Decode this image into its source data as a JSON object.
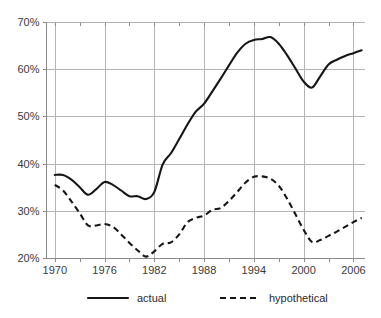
{
  "chart_data": {
    "type": "line",
    "title": "",
    "xlabel": "",
    "ylabel": "",
    "xlim": [
      1969.0,
      2007.4
    ],
    "ylim": [
      20,
      70
    ],
    "grid": true,
    "legend_position": "bottom",
    "y_ticks": [
      20,
      30,
      40,
      50,
      60,
      70
    ],
    "y_tick_labels": [
      "20%",
      "30%",
      "40%",
      "50%",
      "60%",
      "70%"
    ],
    "x_ticks": [
      1970,
      1976,
      1982,
      1988,
      1994,
      2000,
      2006
    ],
    "x_tick_labels": [
      "1970",
      "1976",
      "1982",
      "1988",
      "1994",
      "2000",
      "2006"
    ],
    "x_minor_ticks": [
      1973,
      1979,
      1985,
      1991,
      1997,
      2003
    ],
    "series": [
      {
        "name": "actual",
        "style": "solid",
        "color": "#161616",
        "x": [
          1970,
          1971,
          1972,
          1973,
          1974,
          1975,
          1976,
          1977,
          1978,
          1979,
          1980,
          1981,
          1982,
          1983,
          1984,
          1985,
          1986,
          1987,
          1988,
          1989,
          1990,
          1991,
          1992,
          1993,
          1994,
          1995,
          1996,
          1997,
          1998,
          1999,
          2000,
          2001,
          2002,
          2003,
          2004,
          2005,
          2006,
          2007
        ],
        "values": [
          37.6,
          37.6,
          36.6,
          35.0,
          33.4,
          34.6,
          36.1,
          35.5,
          34.3,
          33.1,
          33.1,
          32.5,
          34.0,
          39.8,
          42.2,
          45.2,
          48.3,
          51.0,
          52.7,
          55.3,
          58.0,
          60.8,
          63.5,
          65.4,
          66.2,
          66.4,
          66.8,
          65.4,
          63.0,
          60.2,
          57.4,
          56.1,
          58.5,
          61.0,
          62.0,
          62.8,
          63.4,
          64.0
        ]
      },
      {
        "name": "hypothetical",
        "style": "dashed",
        "color": "#161616",
        "x": [
          1970,
          1971,
          1972,
          1973,
          1974,
          1975,
          1976,
          1977,
          1978,
          1979,
          1980,
          1981,
          1982,
          1983,
          1984,
          1985,
          1986,
          1987,
          1988,
          1989,
          1990,
          1991,
          1992,
          1993,
          1994,
          1995,
          1996,
          1997,
          1998,
          1999,
          2000,
          2001,
          2002,
          2003,
          2004,
          2005,
          2006,
          2007
        ],
        "values": [
          35.5,
          34.3,
          32.0,
          29.5,
          26.9,
          26.9,
          27.2,
          26.6,
          25.0,
          23.2,
          21.6,
          20.3,
          21.4,
          23.0,
          23.3,
          25.0,
          27.6,
          28.5,
          29.0,
          30.2,
          30.6,
          32.1,
          34.0,
          36.0,
          37.2,
          37.3,
          36.8,
          35.3,
          32.6,
          29.3,
          26.0,
          23.4,
          23.8,
          24.7,
          25.6,
          26.6,
          27.6,
          28.5
        ]
      }
    ],
    "legend": [
      {
        "label": "actual",
        "style": "solid"
      },
      {
        "label": "hypothetical",
        "style": "dashed"
      }
    ]
  },
  "colors": {
    "line": "#161616",
    "grid": "#b4b4b4",
    "axis": "#8a8a8a",
    "text": "#3a3a3a",
    "background": "#ffffff"
  }
}
